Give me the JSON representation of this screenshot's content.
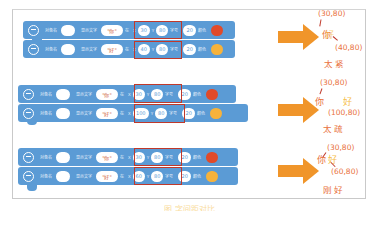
{
  "caption": "图 字间距对比",
  "labels": {
    "role": "对象名",
    "display_text": "显示文字",
    "at": "在",
    "x": "X",
    "y": "Y",
    "size": "字号",
    "color": "颜色"
  },
  "colors": {
    "block": "#5b9bd5",
    "highlight_box": "#c0392b",
    "arrow": "#f0952a",
    "red_dot": "#e04a2a",
    "yellow_dot": "#f6b23b",
    "label_orange": "#e9713d",
    "label_yellow": "#f6c04a"
  },
  "examples": [
    {
      "rows": [
        {
          "text": "\"你\"",
          "x": "30",
          "y": "80",
          "size": "20",
          "color": "red"
        },
        {
          "text": "\"好\"",
          "x": "40",
          "y": "80",
          "size": "20",
          "color": "yellow"
        }
      ],
      "result": {
        "coord1": "(30,80)",
        "coord2": "(40,80)",
        "char1": "你",
        "char2": "好",
        "verdict": "太紧"
      }
    },
    {
      "rows": [
        {
          "text": "\"你\"",
          "x": "30",
          "y": "80",
          "size": "20",
          "color": "red"
        },
        {
          "text": "\"好\"",
          "x": "100",
          "y": "80",
          "size": "20",
          "color": "yellow"
        }
      ],
      "result": {
        "coord1": "(30,80)",
        "coord2": "(100,80)",
        "char1": "你",
        "char2": "好",
        "verdict": "太疏"
      }
    },
    {
      "rows": [
        {
          "text": "\"你\"",
          "x": "30",
          "y": "80",
          "size": "20",
          "color": "red"
        },
        {
          "text": "\"好\"",
          "x": "60",
          "y": "80",
          "size": "20",
          "color": "yellow"
        }
      ],
      "result": {
        "coord1": "(30,80)",
        "coord2": "(60,80)",
        "char1": "你",
        "char2": "好",
        "verdict": "刚好"
      }
    }
  ]
}
